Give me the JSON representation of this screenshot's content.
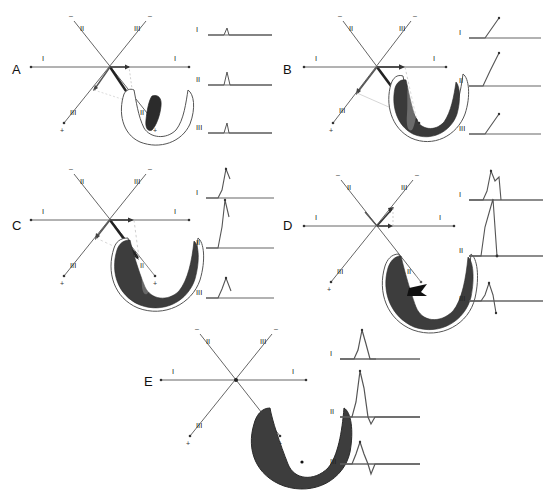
{
  "figure": {
    "title": "",
    "background_color": "#ffffff",
    "panel_count": 5,
    "axis_system": {
      "name": "Einthoven triangle axes",
      "leads": [
        "I",
        "II",
        "III"
      ],
      "negative_sign": "–",
      "positive_sign": "+",
      "lead_I_left_label": "I",
      "lead_I_right_label": "I",
      "lead_II_top_label": "II",
      "lead_II_bottom_label": "II",
      "lead_III_top_label": "III",
      "lead_III_bottom_label": "III"
    },
    "ecg_lead_labels": [
      "I",
      "II",
      "III"
    ],
    "colors": {
      "line": "#555555",
      "axis": "#666666",
      "vector": "#222222",
      "projection": "#aaaaaa",
      "myocardium_outline": "#444444",
      "myocardium_activated": "#3a3a3a",
      "text": "#1a1a1a",
      "ecg_trace": "#555555"
    }
  },
  "panels": [
    {
      "id": "A",
      "letter": "A",
      "caption": "",
      "heart": {
        "activation_state": "septal",
        "activated_fill": "#2b2b2b",
        "outline_only": true
      },
      "vectors": [
        {
          "name": "mean-vector",
          "angle_deg": 65,
          "length": 38,
          "magnitude": "small"
        }
      ],
      "ecg": [
        {
          "lead": "I",
          "label": "I",
          "amplitude": 7,
          "polarity": "positive",
          "shape": "small-r"
        },
        {
          "lead": "II",
          "label": "II",
          "amplitude": 13,
          "polarity": "positive",
          "shape": "small-r"
        },
        {
          "lead": "III",
          "label": "III",
          "amplitude": 10,
          "polarity": "positive",
          "shape": "small-r"
        }
      ]
    },
    {
      "id": "B",
      "letter": "B",
      "caption": "",
      "heart": {
        "activation_state": "apical-and-septal",
        "activated_fill": "#3a3a3a",
        "outline_only": false
      },
      "vectors": [
        {
          "name": "mean-vector",
          "angle_deg": 60,
          "length": 72,
          "magnitude": "large"
        }
      ],
      "ecg": [
        {
          "lead": "I",
          "label": "I",
          "amplitude": 20,
          "polarity": "positive",
          "shape": "rising-slope"
        },
        {
          "lead": "II",
          "label": "II",
          "amplitude": 30,
          "polarity": "positive",
          "shape": "rising-slope"
        },
        {
          "lead": "III",
          "label": "III",
          "amplitude": 20,
          "polarity": "positive",
          "shape": "rising-slope"
        }
      ]
    },
    {
      "id": "C",
      "letter": "C",
      "caption": "",
      "heart": {
        "activation_state": "most-of-ventricles",
        "activated_fill": "#3d3d3d",
        "outline_only": false
      },
      "vectors": [
        {
          "name": "mean-vector",
          "angle_deg": 62,
          "length": 46,
          "magnitude": "medium"
        }
      ],
      "ecg": [
        {
          "lead": "I",
          "label": "I",
          "amplitude": 26,
          "polarity": "positive",
          "shape": "tall-R"
        },
        {
          "lead": "II",
          "label": "II",
          "amplitude": 42,
          "polarity": "positive",
          "shape": "tall-R"
        },
        {
          "lead": "III",
          "label": "III",
          "amplitude": 20,
          "polarity": "positive",
          "shape": "tall-R"
        }
      ]
    },
    {
      "id": "D",
      "letter": "D",
      "caption": "",
      "heart": {
        "activation_state": "nearly-complete-basal",
        "activated_fill": "#3d3d3d",
        "outline_only": false
      },
      "vectors": [
        {
          "name": "mean-vector",
          "angle_deg": -55,
          "length": 26,
          "magnitude": "small-upward"
        }
      ],
      "ecg": [
        {
          "lead": "I",
          "label": "I",
          "amplitude": 24,
          "polarity": "positive",
          "shape": "R-with-notch"
        },
        {
          "lead": "II",
          "label": "II",
          "amplitude": -34,
          "polarity": "negative",
          "shape": "deep-S"
        },
        {
          "lead": "III",
          "label": "III",
          "amplitude": -22,
          "polarity": "biphasic",
          "shape": "rS"
        }
      ]
    },
    {
      "id": "E",
      "letter": "E",
      "caption": "",
      "heart": {
        "activation_state": "fully-depolarized",
        "activated_fill": "#3d3d3d",
        "outline_only": false
      },
      "vectors": [],
      "ecg": [
        {
          "lead": "I",
          "label": "I",
          "amplitude": 26,
          "polarity": "positive",
          "shape": "complete-QRS"
        },
        {
          "lead": "II",
          "label": "II",
          "amplitude": 46,
          "polarity": "positive",
          "shape": "complete-QRS"
        },
        {
          "lead": "III",
          "label": "III",
          "amplitude": 30,
          "polarity": "positive",
          "shape": "complete-QRS"
        }
      ]
    }
  ]
}
